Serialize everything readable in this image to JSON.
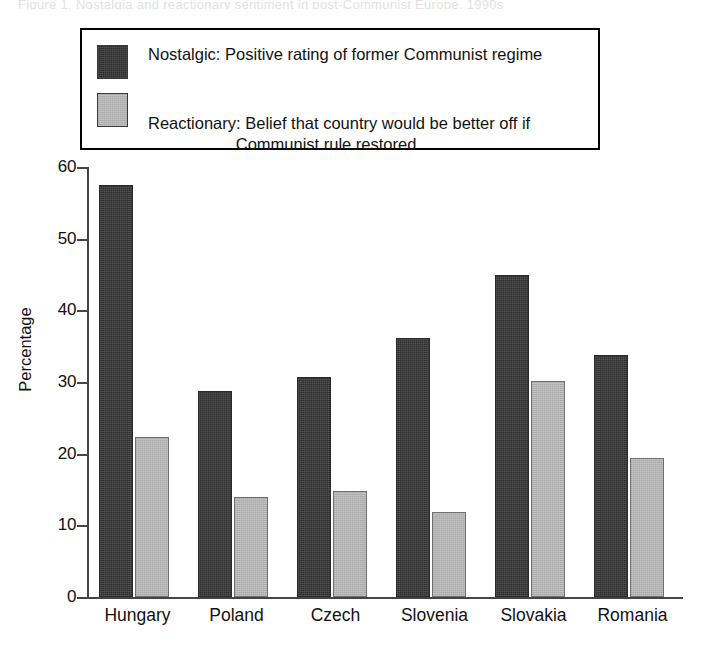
{
  "figure": {
    "caption_sliver": "Figure 1.  Nostalgia and reactionary sentiment in post-Communist Europe, 1990s"
  },
  "legend": {
    "position": "top-inside",
    "entries": [
      {
        "swatch": "dark-swatch",
        "color": "#2e2e2e",
        "label": "Nostalgic: Positive rating of former Communist regime",
        "line1": "Nostalgic: Positive rating of former Communist regime",
        "line2": ""
      },
      {
        "swatch": "light-swatch",
        "color": "#b2b2b2",
        "label": "Reactionary: Belief that country would be better off if Communist rule restored",
        "line1": "Reactionary: Belief that country would be better off if",
        "line2": "Communist rule restored"
      }
    ]
  },
  "axes": {
    "ylabel": "Percentage",
    "yticks": [
      "0",
      "10",
      "20",
      "30",
      "40",
      "50",
      "60"
    ],
    "ymin": 0,
    "ymax": 60
  },
  "chart_data": {
    "type": "bar",
    "title": "",
    "subtitle": "",
    "xlabel": "",
    "ylabel": "Percentage",
    "ylim": [
      0,
      60
    ],
    "ytick_step": 10,
    "grid": false,
    "legend_position": "top-inside",
    "categories": [
      "Hungary",
      "Poland",
      "Czech",
      "Slovenia",
      "Slovakia",
      "Romania"
    ],
    "series": [
      {
        "name": "Nostalgic: Positive rating of former Communist regime",
        "short_name": "Nostalgic",
        "color": "#2e2e2e",
        "values": [
          57.5,
          28.8,
          30.7,
          36.2,
          44.9,
          33.8
        ]
      },
      {
        "name": "Reactionary: Belief that country would be better off if Communist rule restored",
        "short_name": "Reactionary",
        "color": "#b2b2b2",
        "values": [
          22.3,
          14.0,
          14.8,
          11.9,
          30.1,
          19.4
        ]
      }
    ]
  }
}
